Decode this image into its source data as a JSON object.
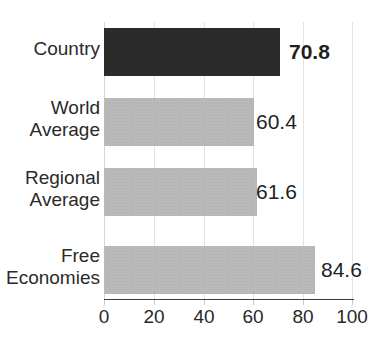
{
  "chart_data": {
    "type": "bar",
    "orientation": "horizontal",
    "title": "",
    "xlabel": "",
    "ylabel": "",
    "categories": [
      "Country",
      "World\nAverage",
      "Regional\nAverage",
      "Free\nEconomies"
    ],
    "values": [
      70.8,
      60.4,
      61.6,
      84.6
    ],
    "value_labels": [
      "70.8",
      "60.4",
      "61.6",
      "84.6"
    ],
    "highlight_index": 0,
    "xlim": [
      0,
      100
    ],
    "xticks": [
      0,
      20,
      40,
      60,
      80,
      100
    ],
    "xtick_labels": [
      "0",
      "20",
      "40",
      "60",
      "80",
      "100"
    ],
    "grid": true,
    "legend": "none",
    "colors": {
      "highlight_bar": "#2b2b2b",
      "bar": "#b9b9b9",
      "gridline": "#e2e2e2",
      "axis_line": "#3a3a3a",
      "text": "#2a2a2a",
      "background": "#ffffff"
    }
  }
}
